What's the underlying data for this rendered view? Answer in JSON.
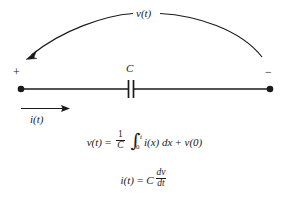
{
  "figure": {
    "type": "capacitor-circuit-element-diagram",
    "title_label": "",
    "colors": {
      "ink": "#1a1a1a",
      "background": "#ffffff"
    }
  },
  "diagram": {
    "voltage_arc_label": "v(t)",
    "polarity_positive": "+",
    "polarity_negative": "−",
    "component_label": "C",
    "current_label": "i(t)",
    "arc_direction": "right-to-left",
    "current_direction": "left-to-right"
  },
  "equations": {
    "eq1": {
      "lhs": "v(t)",
      "equals": "=",
      "fraction_numerator": "1",
      "fraction_denominator": "C",
      "integral_symbol": "∫",
      "integral_lower_limit": "0",
      "integral_upper_limit": "t",
      "integrand": "i(x) dx",
      "plus": "+",
      "initial_condition": "v(0)",
      "plain": "v(t) = (1/C) ∫₀ᵗ i(x) dx + v(0)"
    },
    "eq2": {
      "lhs": "i(t)",
      "equals": "=",
      "coefficient": "C",
      "fraction_numerator": "dv",
      "fraction_denominator": "dt",
      "plain": "i(t) = C dv/dt"
    }
  }
}
